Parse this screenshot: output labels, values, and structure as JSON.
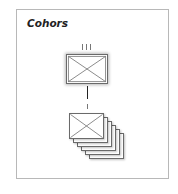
{
  "title": "Cohors",
  "diagram": {
    "top_unit": {
      "label": "",
      "symbol": "infantry-cross",
      "size_marker": "III",
      "marker_ticks": 3
    },
    "connector": {
      "style": "solid-then-dashed"
    },
    "bottom_unit": {
      "label": "",
      "symbol": "infantry-cross",
      "size_marker": "I",
      "marker_ticks": 1,
      "stack_count": 6
    }
  }
}
